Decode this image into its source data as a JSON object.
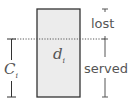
{
  "diagram": {
    "box_label_var": "d",
    "box_label_sub": "i",
    "capacity_label_var": "C",
    "capacity_label_sub": "i",
    "lost_label": "lost",
    "served_label": "served",
    "colors": {
      "box_fill": "#ececec",
      "stroke": "#333333",
      "dotted_line": "#555555",
      "text": "#555555"
    }
  }
}
